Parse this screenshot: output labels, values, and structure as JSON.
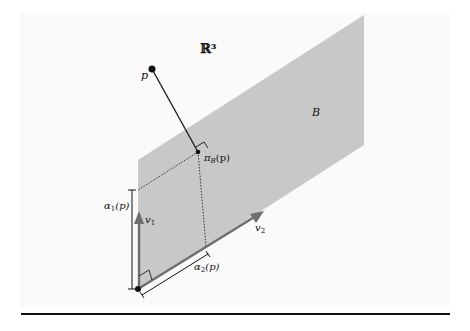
{
  "figure": {
    "space_label": "ℝ³",
    "plane_label": "B",
    "point_label": "p",
    "projection_label": "π",
    "projection_sub": "B",
    "projection_arg": "(p)",
    "v1_label": "v",
    "v1_sub": "1",
    "v2_label": "v",
    "v2_sub": "2",
    "alpha1_label": "α",
    "alpha1_sub": "1",
    "alpha1_arg": "(p)",
    "alpha2_label": "α",
    "alpha2_sub": "2",
    "alpha2_arg": "(p)"
  },
  "colors": {
    "plane": "#c8c8c8",
    "vector": "#6e6e6e",
    "ink": "#111111",
    "background": "#fafafa"
  }
}
